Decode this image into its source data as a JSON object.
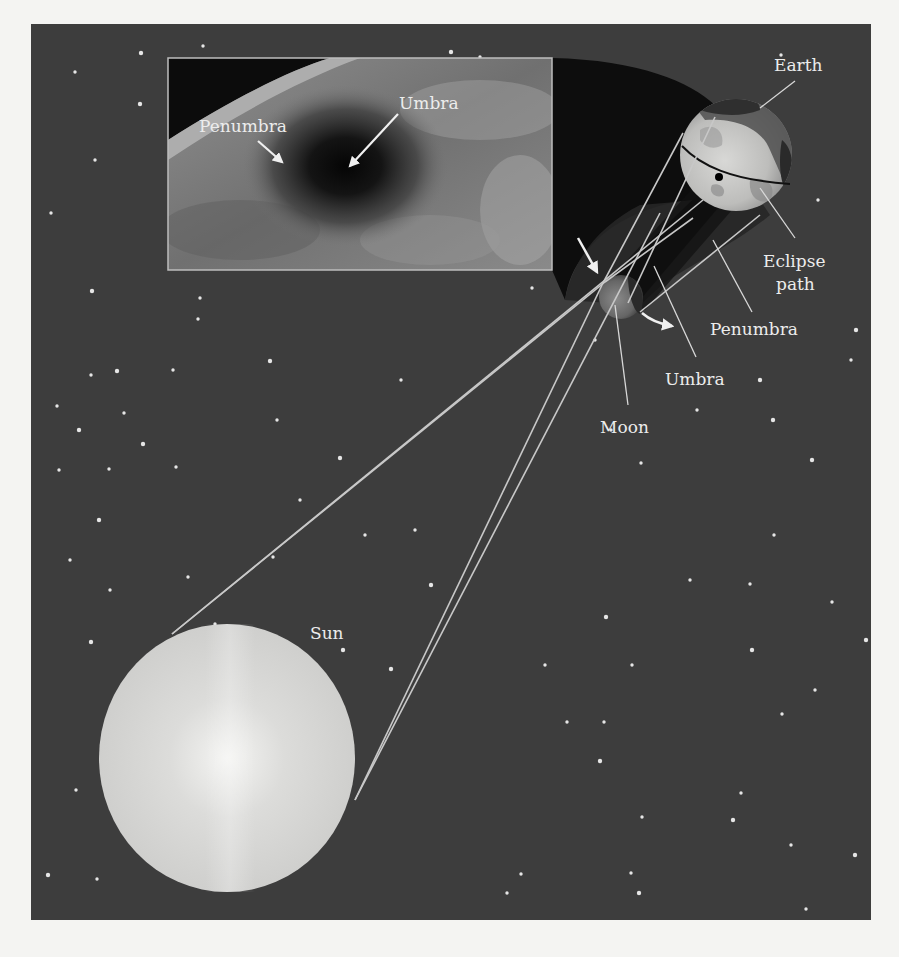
{
  "figure": {
    "type": "solar-eclipse-diagram",
    "background_color": "#3d3d3d",
    "page_color": "#f4f4f2"
  },
  "bodies": {
    "sun": {
      "label": "Sun",
      "cx": 227,
      "cy": 758,
      "r": 133
    },
    "moon": {
      "label": "Moon",
      "cx": 621,
      "cy": 297,
      "r": 22
    },
    "earth": {
      "label": "Earth",
      "cx": 736,
      "cy": 155,
      "r": 56
    }
  },
  "inset_photo": {
    "x": 168,
    "y": 58,
    "width": 384,
    "height": 212,
    "labels": {
      "penumbra": "Penumbra",
      "umbra": "Umbra"
    }
  },
  "labels": {
    "earth": "Earth",
    "eclipse_path_line1": "Eclipse",
    "eclipse_path_line2": "path",
    "penumbra": "Penumbra",
    "umbra": "Umbra",
    "moon": "Moon",
    "sun": "Sun"
  },
  "shadow_regions": [
    "Penumbra",
    "Umbra"
  ],
  "stars": [
    [
      141,
      53
    ],
    [
      203,
      46
    ],
    [
      75,
      72
    ],
    [
      140,
      104
    ],
    [
      95,
      160
    ],
    [
      51,
      213
    ],
    [
      92,
      291
    ],
    [
      200,
      298
    ],
    [
      91,
      375
    ],
    [
      117,
      371
    ],
    [
      173,
      370
    ],
    [
      57,
      406
    ],
    [
      79,
      430
    ],
    [
      124,
      413
    ],
    [
      109,
      469
    ],
    [
      143,
      444
    ],
    [
      176,
      467
    ],
    [
      59,
      470
    ],
    [
      99,
      520
    ],
    [
      188,
      577
    ],
    [
      198,
      319
    ],
    [
      270,
      361
    ],
    [
      277,
      420
    ],
    [
      300,
      500
    ],
    [
      340,
      458
    ],
    [
      401,
      380
    ],
    [
      415,
      530
    ],
    [
      431,
      585
    ],
    [
      365,
      535
    ],
    [
      273,
      557
    ],
    [
      343,
      650
    ],
    [
      205,
      640
    ],
    [
      215,
      624
    ],
    [
      91,
      642
    ],
    [
      76,
      790
    ],
    [
      97,
      879
    ],
    [
      391,
      669
    ],
    [
      545,
      665
    ],
    [
      567,
      722
    ],
    [
      600,
      761
    ],
    [
      642,
      817
    ],
    [
      631,
      873
    ],
    [
      602,
      969
    ],
    [
      521,
      874
    ],
    [
      507,
      893
    ],
    [
      391,
      924
    ],
    [
      611,
      430
    ],
    [
      641,
      463
    ],
    [
      773,
      420
    ],
    [
      774,
      535
    ],
    [
      750,
      584
    ],
    [
      606,
      617
    ],
    [
      832,
      602
    ],
    [
      632,
      665
    ],
    [
      752,
      650
    ],
    [
      815,
      690
    ],
    [
      604,
      722
    ],
    [
      866,
      640
    ],
    [
      741,
      793
    ],
    [
      660,
      932
    ],
    [
      639,
      893
    ],
    [
      712,
      937
    ],
    [
      791,
      845
    ],
    [
      855,
      855
    ],
    [
      806,
      909
    ],
    [
      614,
      920
    ],
    [
      733,
      820
    ],
    [
      690,
      580
    ],
    [
      782,
      714
    ],
    [
      812,
      460
    ],
    [
      851,
      360
    ],
    [
      818,
      200
    ],
    [
      856,
      330
    ],
    [
      781,
      55
    ],
    [
      527,
      80
    ],
    [
      451,
      52
    ],
    [
      480,
      57
    ],
    [
      532,
      288
    ],
    [
      655,
      90
    ],
    [
      595,
      340
    ],
    [
      697,
      410
    ],
    [
      760,
      380
    ],
    [
      240,
      740
    ],
    [
      190,
      716
    ],
    [
      150,
      675
    ],
    [
      110,
      590
    ],
    [
      70,
      560
    ],
    [
      48,
      875
    ]
  ]
}
